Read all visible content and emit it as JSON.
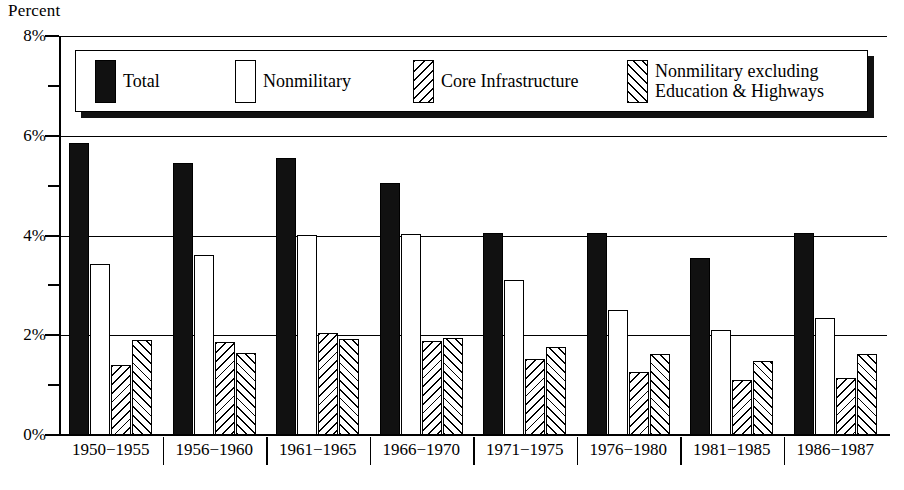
{
  "chart_data": {
    "type": "bar",
    "title": "",
    "ylabel": "Percent",
    "xlabel": "",
    "ylim": [
      0,
      8
    ],
    "grid": true,
    "legend_position": "top-inside",
    "y_tick_labels": [
      "8%",
      "6%",
      "4%",
      "2%",
      "0%"
    ],
    "y_tick_values": [
      8,
      6,
      4,
      2,
      0
    ],
    "y_minor_ticks": [
      7,
      5,
      3,
      1
    ],
    "categories": [
      "1950−1955",
      "1956−1960",
      "1961−1965",
      "1966−1970",
      "1971−1975",
      "1976−1980",
      "1981−1985",
      "1986−1987"
    ],
    "series": [
      {
        "name": "Total",
        "fill": "solid-black",
        "values": [
          5.85,
          5.45,
          5.55,
          5.05,
          4.05,
          4.05,
          3.55,
          4.05
        ]
      },
      {
        "name": "Nonmilitary",
        "fill": "white-outline",
        "values": [
          3.42,
          3.6,
          4.02,
          4.03,
          3.1,
          2.5,
          2.1,
          2.35
        ]
      },
      {
        "name": "Core Infrastructure",
        "fill": "hatch-backslash",
        "values": [
          1.4,
          1.87,
          2.05,
          1.88,
          1.52,
          1.27,
          1.1,
          1.15
        ]
      },
      {
        "name": "Nonmilitary excluding\nEducation & Highways",
        "fill": "hatch-forwardslash",
        "values": [
          1.9,
          1.65,
          1.92,
          1.95,
          1.77,
          1.62,
          1.48,
          1.63
        ]
      }
    ]
  },
  "legend": {
    "items": [
      {
        "label": "Total",
        "swatch": "solid-black"
      },
      {
        "label": "Nonmilitary",
        "swatch": "white-outline"
      },
      {
        "label": "Core Infrastructure",
        "swatch": "hatch-backslash"
      },
      {
        "label": "Nonmilitary excluding\nEducation & Highways",
        "swatch": "hatch-forwardslash"
      }
    ]
  },
  "axis": {
    "y_title": "Percent"
  }
}
